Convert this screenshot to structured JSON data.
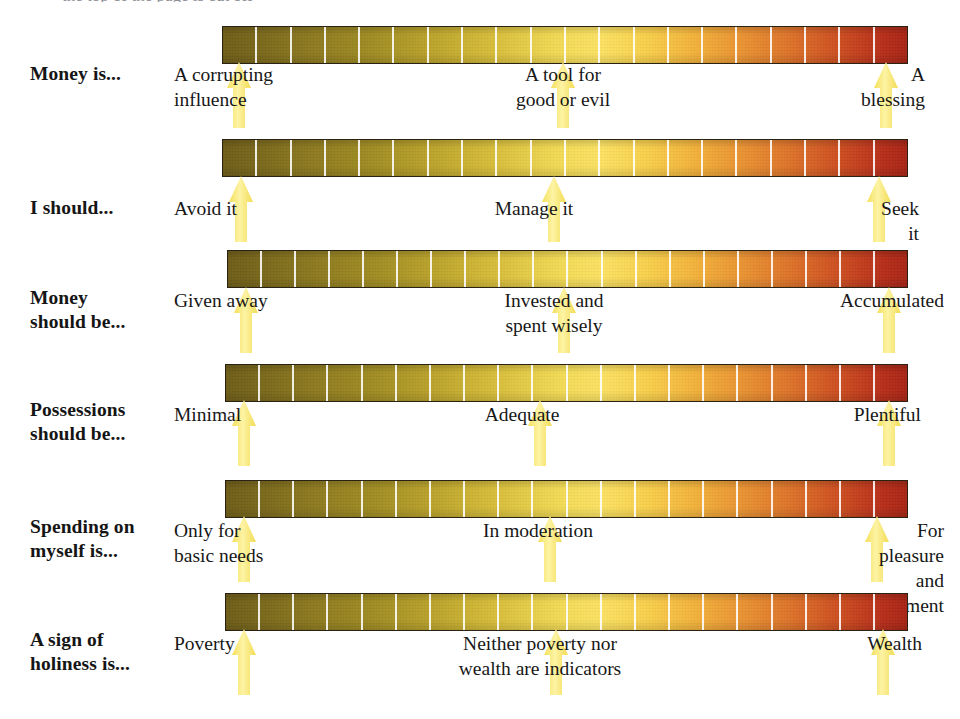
{
  "figure": {
    "type": "likert-spectrum-chart",
    "title_clipped": "the top of the page is cut off",
    "background": "#ffffff",
    "bar": {
      "segments": 20,
      "tick_color": "#ffffff",
      "border_color": "#2a2313",
      "gradient_stops": [
        "#6e5d18",
        "#8d7a1f",
        "#a18d23",
        "#bda52c",
        "#d9bf3b",
        "#f2da55",
        "#fbe263",
        "#f8cf4b",
        "#f2b13a",
        "#e99232",
        "#dd7229",
        "#cd4e20",
        "#b9301a",
        "#a82415"
      ],
      "left_pole_color": "#6e5d18",
      "mid_pole_color": "#fbe263",
      "right_pole_color": "#a82415"
    },
    "marker": {
      "shape": "up-arrow",
      "fill": "#f8e96d",
      "fill_light": "#fdf4a8"
    }
  },
  "rows": [
    {
      "id": "money-is",
      "question": "Money is...",
      "left": "A corrupting\ninfluence",
      "center": "A tool for\ngood or evil",
      "right": "A blessing",
      "arrows": [
        "left",
        "center",
        "right"
      ]
    },
    {
      "id": "i-should",
      "question": "I should...",
      "left": "Avoid it",
      "center": "Manage it",
      "right": "Seek it",
      "arrows": [
        "left",
        "center",
        "right"
      ]
    },
    {
      "id": "money-should-be",
      "question": "Money\nshould be...",
      "left": "Given away",
      "center": "Invested and\nspent wisely",
      "right": "Accumulated",
      "arrows": [
        "left",
        "center",
        "right"
      ]
    },
    {
      "id": "possessions-should-be",
      "question": "Possessions\nshould be...",
      "left": "Minimal",
      "center": "Adequate",
      "right": "Plentiful",
      "arrows": [
        "left",
        "center",
        "right"
      ]
    },
    {
      "id": "spending-on-myself",
      "question": "Spending on\nmyself is...",
      "left": "Only for\nbasic needs",
      "center": "In moderation",
      "right": "For pleasure\nand enjoyment",
      "arrows": [
        "left",
        "center",
        "right"
      ]
    },
    {
      "id": "sign-of-holiness",
      "question": "A sign of\nholiness is...",
      "left": "Poverty",
      "center": "Neither poverty nor\nwealth are indicators",
      "right": "Wealth",
      "arrows": [
        "left",
        "center",
        "right"
      ]
    }
  ]
}
